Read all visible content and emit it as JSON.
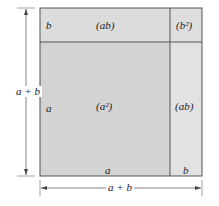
{
  "diagram": {
    "title": "",
    "colors": {
      "top_strip": "#dcdcdc",
      "main_square": "#d3d3d3",
      "right_strip": "#e2e2e2",
      "corner": "#dedede",
      "border": "#555555"
    },
    "regions": {
      "top_left_side": "b",
      "top_rect": "(ab)",
      "top_right": "(b²)",
      "left_side": "a",
      "big_square": "(a²)",
      "right_rect": "(ab)",
      "bottom_a": "a",
      "bottom_b": "b"
    },
    "dimensions": {
      "vertical": "a + b",
      "horizontal": "a + b"
    }
  }
}
